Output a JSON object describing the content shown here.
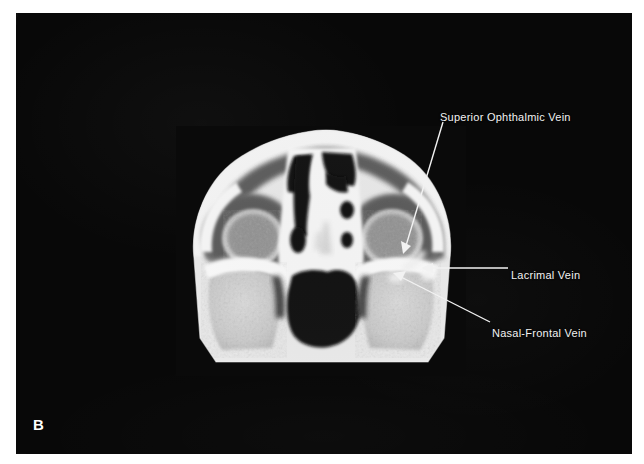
{
  "figure": {
    "panel_letter": "B",
    "modality": "axial-ct-orbits",
    "plate_background_color": "#080808",
    "annotation_color": "#f2f2f2"
  },
  "annotations": [
    {
      "id": "superior-ophthalmic-vein",
      "label": "Superior Ophthalmic Vein",
      "leader": "diagonal-down-left",
      "arrow_tip": [
        403,
        252
      ],
      "arrow_tail": [
        443,
        122
      ]
    },
    {
      "id": "lacrimal-vein",
      "label": "Lacrimal Vein",
      "leader": "horizontal-left",
      "arrow_tip": [
        423,
        268
      ],
      "arrow_tail": [
        508,
        268
      ]
    },
    {
      "id": "nasal-frontal-vein",
      "label": "Nasal-Frontal Vein",
      "leader": "diagonal-up-left",
      "arrow_tip": [
        393,
        274
      ],
      "arrow_tail": [
        490,
        322
      ]
    }
  ]
}
